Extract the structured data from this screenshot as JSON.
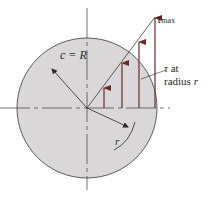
{
  "diagram": {
    "labels": {
      "radius_outer": "c = R",
      "tau_max_symbol": "τ",
      "tau_max_sub": "max",
      "tau_at_line1_sym": "τ",
      "tau_at_line1_rest": " at",
      "tau_at_line2": "radius ",
      "tau_at_line2_r": "r",
      "inner_radius": "r"
    },
    "colors": {
      "disk_fill": "#d9d7d8",
      "outline": "#3a3a3a",
      "arrow": "#6b2a2a",
      "background": "#ffffff"
    },
    "geometry": {
      "center": [
        87,
        108
      ],
      "radius": 70,
      "arrow_x": [
        104,
        122,
        139,
        155
      ]
    }
  }
}
